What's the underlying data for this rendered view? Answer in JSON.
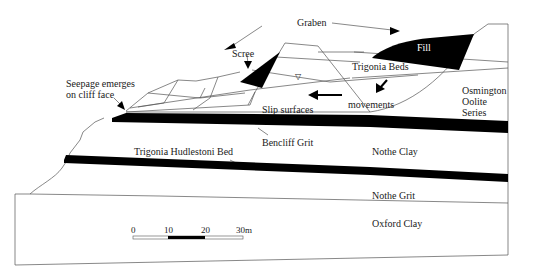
{
  "diagram": {
    "type": "geological-cross-section",
    "labels": {
      "graben": "Graben",
      "fill": "Fill",
      "scree": "Scree",
      "trigonia_beds": "Trigonia Beds",
      "seepage": "Seepage emerges\non cliff face",
      "slip_surfaces": "Slip surfaces",
      "movements": "movements",
      "osmington": "Osmington\nOolite\nSeries",
      "bencliff_grit": "Bencliff Grit",
      "nothe_clay": "Nothe Clay",
      "trigonia_hudlestoni": "Trigonia Hudlestoni Bed",
      "nothe_grit": "Nothe Grit",
      "oxford_clay": "Oxford Clay"
    },
    "scale_bar": {
      "ticks": [
        "0",
        "10",
        "20",
        "30m"
      ],
      "unit": "m",
      "max": 30
    },
    "colors": {
      "line": "#555555",
      "fill_black": "#000000",
      "background": "#ffffff"
    },
    "symbols": {
      "water_table": "▽"
    }
  }
}
